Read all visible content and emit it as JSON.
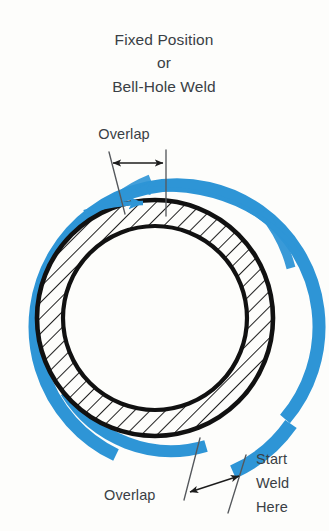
{
  "figure": {
    "kind": "welding-procedure-diagram"
  },
  "title": {
    "line1": "Fixed Position",
    "line2": "or",
    "line3": "Bell-Hole Weld"
  },
  "labels": {
    "overlap_top": "Overlap",
    "overlap_bottom": "Overlap",
    "start_weld": {
      "line1": "Start",
      "line2": "Weld",
      "line3": "Here"
    }
  },
  "colors": {
    "weld_blue": "#2e95d6",
    "pipe_black": "#111111",
    "text_gray": "#3a3f45",
    "dimension_black": "#1c1c1c",
    "extension_gray": "#55585c",
    "background": "#fdfdfb"
  },
  "geometry": {
    "center_x": 155,
    "center_y": 318,
    "pipe_outer_radius": 118,
    "pipe_inner_radius": 92,
    "weld_arc_radius": 140,
    "weld_arc_width": 13,
    "hatch_angle_deg": 45
  }
}
